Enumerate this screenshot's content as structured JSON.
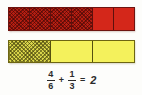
{
  "worksheet": {
    "title": "Fraction bar addition model",
    "background_color": "#fdfdfb"
  },
  "models": [
    {
      "id": "bar-sixths",
      "name": "sixths-bar",
      "total_parts": 6,
      "shaded_parts": 4,
      "fill_color": "#d4271a",
      "shaded_color": "#b51e12",
      "border_color": "#6e1410",
      "cells": [
        {
          "index": 1,
          "shaded": true
        },
        {
          "index": 2,
          "shaded": true
        },
        {
          "index": 3,
          "shaded": true
        },
        {
          "index": 4,
          "shaded": true
        },
        {
          "index": 5,
          "shaded": false
        },
        {
          "index": 6,
          "shaded": false
        }
      ]
    },
    {
      "id": "bar-thirds",
      "name": "thirds-bar",
      "total_parts": 3,
      "shaded_parts": 1,
      "fill_color": "#f4f15c",
      "shaded_color": "#d8d44a",
      "border_color": "#6d6512",
      "cells": [
        {
          "index": 1,
          "shaded": true
        },
        {
          "index": 2,
          "shaded": false
        },
        {
          "index": 3,
          "shaded": false
        }
      ]
    }
  ],
  "equation": {
    "first_fraction": {
      "numerator": "4",
      "denominator": "6"
    },
    "operator": "+",
    "second_fraction": {
      "numerator": "1",
      "denominator": "3"
    },
    "equals": "=",
    "result": "2",
    "text_color": "#2b2b2b"
  }
}
